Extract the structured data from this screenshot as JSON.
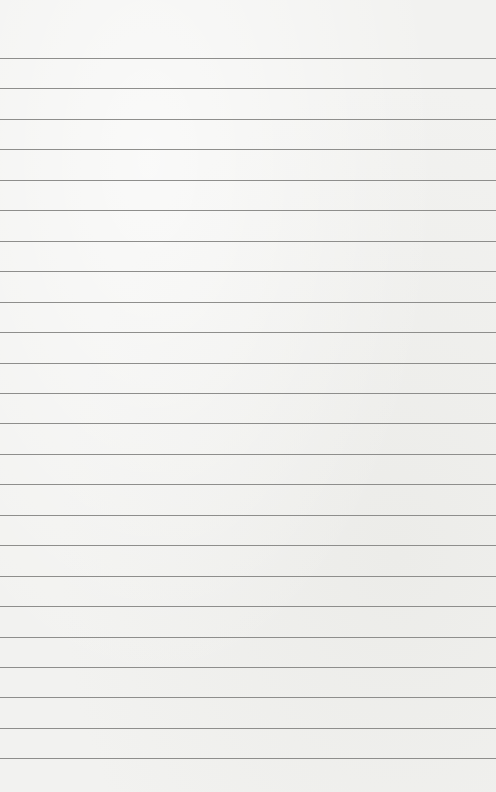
{
  "paper": {
    "type": "lined-notebook-paper",
    "background_color": "#f2f2f0",
    "line_color": "#8e8e8c",
    "first_line_y": 58,
    "line_spacing": 30.45,
    "line_count": 24
  }
}
